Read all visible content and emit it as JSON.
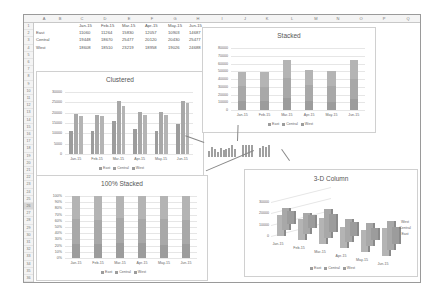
{
  "spreadsheet": {
    "columns": [
      "A",
      "B",
      "C",
      "D",
      "E",
      "F",
      "G",
      "H",
      "I",
      "J",
      "K",
      "L",
      "M",
      "N",
      "O",
      "P",
      "Q"
    ],
    "rows": [
      "1",
      "2",
      "3",
      "4",
      "5",
      "6",
      "7",
      "8",
      "9",
      "10",
      "11",
      "12",
      "13",
      "14",
      "15",
      "16",
      "17",
      "18",
      "19",
      "20",
      "21",
      "22",
      "23",
      "24",
      "25",
      "26",
      "27",
      "28",
      "29",
      "30",
      "31",
      "32",
      "33",
      "34",
      "35",
      "36"
    ],
    "selected_row": "26",
    "header_row": [
      "",
      "Jan-15",
      "Feb-15",
      "Mar-15",
      "Apr-15",
      "May-15",
      "Jun-15"
    ],
    "data_rows": [
      {
        "label": "East",
        "values": [
          "11060",
          "11264",
          "15830",
          "12057",
          "10903",
          "14687"
        ]
      },
      {
        "label": "Central",
        "values": [
          "19448",
          "18670",
          "25477",
          "20120",
          "20430",
          "25477"
        ]
      },
      {
        "label": "West",
        "values": [
          "18608",
          "18510",
          "23219",
          "18958",
          "19026",
          "24688"
        ]
      }
    ]
  },
  "chart_data": [
    {
      "type": "bar",
      "title": "Clustered",
      "categories": [
        "Jan-15",
        "Feb-15",
        "Mar-15",
        "Apr-15",
        "May-15",
        "Jun-15"
      ],
      "series": [
        {
          "name": "East",
          "values": [
            11060,
            11264,
            15830,
            12057,
            10903,
            14687
          ]
        },
        {
          "name": "Central",
          "values": [
            19448,
            18670,
            25477,
            20120,
            20430,
            25477
          ]
        },
        {
          "name": "West",
          "values": [
            18608,
            18510,
            23219,
            18958,
            19026,
            24688
          ]
        }
      ],
      "ylim": [
        0,
        30000
      ],
      "yticks": [
        "0",
        "5000",
        "10000",
        "15000",
        "20000",
        "25000",
        "30000"
      ],
      "legend": [
        "East",
        "Central",
        "West"
      ],
      "legend_position": "bottom",
      "grid": true
    },
    {
      "type": "bar",
      "title": "Stacked",
      "stacked": true,
      "categories": [
        "Jan-15",
        "Feb-15",
        "Mar-15",
        "Apr-15",
        "May-15",
        "Jun-15"
      ],
      "series": [
        {
          "name": "East",
          "values": [
            11060,
            11264,
            15830,
            12057,
            10903,
            14687
          ]
        },
        {
          "name": "Central",
          "values": [
            19448,
            18670,
            25477,
            20120,
            20430,
            25477
          ]
        },
        {
          "name": "West",
          "values": [
            18608,
            18510,
            23219,
            18958,
            19026,
            24688
          ]
        }
      ],
      "ylim": [
        0,
        80000
      ],
      "yticks": [
        "0",
        "10000",
        "20000",
        "30000",
        "40000",
        "50000",
        "60000",
        "70000",
        "80000"
      ],
      "legend": [
        "East",
        "Central",
        "West"
      ],
      "legend_position": "bottom",
      "grid": true
    },
    {
      "type": "bar",
      "title": "100% Stacked",
      "stacked_percent": true,
      "categories": [
        "Jan-15",
        "Feb-15",
        "Mar-15",
        "Apr-15",
        "May-15",
        "Jun-15"
      ],
      "series": [
        {
          "name": "East",
          "values": [
            11060,
            11264,
            15830,
            12057,
            10903,
            14687
          ]
        },
        {
          "name": "Central",
          "values": [
            19448,
            18670,
            25477,
            20120,
            20430,
            25477
          ]
        },
        {
          "name": "West",
          "values": [
            18608,
            18510,
            23219,
            18958,
            19026,
            24688
          ]
        }
      ],
      "ylim": [
        0,
        100
      ],
      "yticks": [
        "0%",
        "10%",
        "20%",
        "30%",
        "40%",
        "50%",
        "60%",
        "70%",
        "80%",
        "90%",
        "100%"
      ],
      "legend": [
        "East",
        "Central",
        "West"
      ],
      "legend_position": "bottom",
      "grid": true
    },
    {
      "type": "bar",
      "title": "3-D Column",
      "three_d": true,
      "categories": [
        "Jan-15",
        "Feb-15",
        "Mar-15",
        "Apr-15",
        "May-15",
        "Jun-15"
      ],
      "depth_labels": [
        "West",
        "Central",
        "East"
      ],
      "series": [
        {
          "name": "East",
          "values": [
            11060,
            11264,
            15830,
            12057,
            10903,
            14687
          ]
        },
        {
          "name": "Central",
          "values": [
            19448,
            18670,
            25477,
            20120,
            20430,
            25477
          ]
        },
        {
          "name": "West",
          "values": [
            18608,
            18510,
            23219,
            18958,
            19026,
            24688
          ]
        }
      ],
      "ylim": [
        0,
        30000
      ],
      "yticks": [
        "0",
        "10000",
        "20000",
        "30000"
      ],
      "legend": [
        "East",
        "Central",
        "West"
      ],
      "legend_position": "bottom",
      "grid": true
    }
  ],
  "labels": {
    "legend_east": "East",
    "legend_central": "Central",
    "legend_west": "West"
  }
}
